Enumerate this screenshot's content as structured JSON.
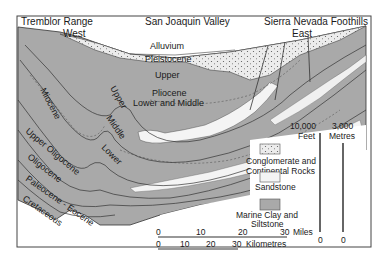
{
  "header": {
    "left": "Tremblor Range",
    "center": "San Joaquin Valley",
    "right": "Sierra Nevada Foothills"
  },
  "directions": {
    "west": "West",
    "east": "East"
  },
  "units": {
    "alluvium": "Alluvium",
    "pleistocene": "Pleistocene",
    "upper": "Upper",
    "pliocene": "Pliocene",
    "pliocene_lower_middle": "Lower and Middle",
    "miocene": "Miocene",
    "miocene_upper": "Upper",
    "miocene_middle": "Middle",
    "miocene_lower": "Lower",
    "upper_oligocene": "Upper Oligocene",
    "oligocene": "Oligocene",
    "paleocene_eocene": "Paleocene - Eocene",
    "cretaceous": "Cretaceous"
  },
  "legend": {
    "items": [
      {
        "label_1": "Conglomerate and",
        "label_2": "Continental Rocks",
        "pattern": "dotted"
      },
      {
        "label_1": "Sandstone",
        "label_2": "",
        "pattern": "white"
      },
      {
        "label_1": "Marine Clay and",
        "label_2": "Siltstone",
        "pattern": "gray"
      }
    ]
  },
  "vertical_scale": {
    "feet_top": "10,000",
    "feet_unit": "Feet",
    "feet_bottom": "0",
    "metres_top": "3,000",
    "metres_unit": "Metres",
    "metres_bottom": "0"
  },
  "horizontal_scale": {
    "miles_ticks": [
      "0",
      "10",
      "20",
      "30"
    ],
    "miles_unit": "Miles",
    "km_ticks": [
      "0",
      "10",
      "20",
      "30"
    ],
    "km_unit": "Kilometres"
  },
  "colors": {
    "clay": "#a9a9a9",
    "clay_dark": "#959595",
    "sandstone": "#f4f4f4",
    "conglomerate": "#e6e6e6",
    "line": "#333333"
  }
}
